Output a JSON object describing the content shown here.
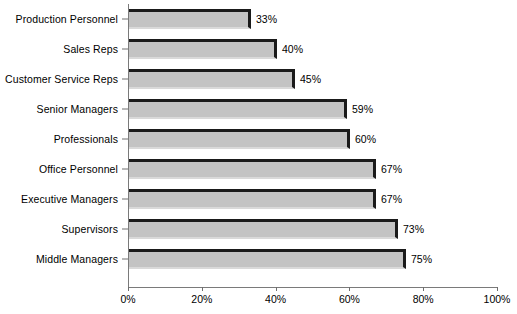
{
  "chart_data": {
    "type": "bar",
    "orientation": "horizontal",
    "title": "",
    "xlabel": "",
    "ylabel": "",
    "xlim": [
      0,
      100
    ],
    "xticks": [
      "0%",
      "20%",
      "40%",
      "60%",
      "80%",
      "100%"
    ],
    "xtick_values": [
      0,
      20,
      40,
      60,
      80,
      100
    ],
    "grid": false,
    "legend": false,
    "value_suffix": "%",
    "categories": [
      "Production Personnel",
      "Sales Reps",
      "Customer Service Reps",
      "Senior Managers",
      "Professionals",
      "Office Personnel",
      "Executive Managers",
      "Supervisors",
      "Middle Managers"
    ],
    "values": [
      33,
      40,
      45,
      59,
      60,
      67,
      67,
      73,
      75
    ],
    "labels": [
      "33%",
      "40%",
      "45%",
      "59%",
      "60%",
      "67%",
      "67%",
      "73%",
      "75%"
    ],
    "colors": {
      "bar_fill": "#c3c3c3",
      "bar_top_edge": "#1a1a1a",
      "bar_bottom_edge": "#d9d9d9",
      "axis": "#7a7a7a",
      "text": "#000000",
      "background": "#ffffff"
    }
  }
}
